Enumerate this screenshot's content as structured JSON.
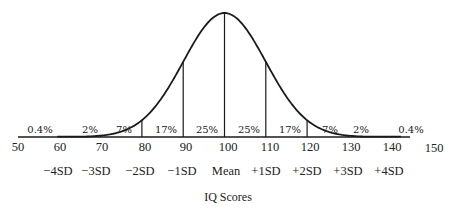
{
  "chart_data": {
    "type": "area",
    "title": "",
    "subtitle": "Normal distribution of IQ scores",
    "xlabel": "IQ Scores",
    "ylabel": "",
    "xlim": [
      50,
      150
    ],
    "grid": false,
    "legend": null,
    "mean": 100,
    "sd": 10,
    "x_ticks": [
      50,
      60,
      70,
      80,
      90,
      100,
      110,
      120,
      130,
      140,
      150
    ],
    "x_tick_labels": [
      "50",
      "60",
      "70",
      "80",
      "90",
      "100",
      "110",
      "120",
      "130",
      "140",
      "150"
    ],
    "sd_labels": [
      {
        "x": 60,
        "label": "−4SD"
      },
      {
        "x": 70,
        "label": "−3SD"
      },
      {
        "x": 80,
        "label": "−2SD"
      },
      {
        "x": 90,
        "label": "−1SD"
      },
      {
        "x": 100,
        "label": "Mean"
      },
      {
        "x": 110,
        "label": "+1SD"
      },
      {
        "x": 120,
        "label": "+2SD"
      },
      {
        "x": 130,
        "label": "+3SD"
      },
      {
        "x": 140,
        "label": "+4SD"
      }
    ],
    "dividers": [
      70,
      80,
      90,
      100,
      110,
      120,
      130
    ],
    "categories": [
      "<60",
      "60-70",
      "70-80",
      "80-90",
      "90-100",
      "100-110",
      "110-120",
      "120-130",
      "130-140",
      ">140"
    ],
    "segments": [
      {
        "from": 50,
        "to": 60,
        "label": "0.4%",
        "value": 0.4
      },
      {
        "from": 60,
        "to": 70,
        "label": "2%",
        "value": 2
      },
      {
        "from": 70,
        "to": 80,
        "label": "7%",
        "value": 7
      },
      {
        "from": 80,
        "to": 90,
        "label": "17%",
        "value": 17
      },
      {
        "from": 90,
        "to": 100,
        "label": "25%",
        "value": 25
      },
      {
        "from": 100,
        "to": 110,
        "label": "25%",
        "value": 25
      },
      {
        "from": 110,
        "to": 120,
        "label": "17%",
        "value": 17
      },
      {
        "from": 120,
        "to": 130,
        "label": "7%",
        "value": 7
      },
      {
        "from": 130,
        "to": 140,
        "label": "2%",
        "value": 2
      },
      {
        "from": 140,
        "to": 150,
        "label": "0.4%",
        "value": 0.4
      }
    ]
  },
  "labels": {
    "pct": [
      "0.4%",
      "2%",
      "7%",
      "17%",
      "25%",
      "25%",
      "17%",
      "7%",
      "2%",
      "0.4%"
    ],
    "ticks": [
      "50",
      "60",
      "70",
      "80",
      "90",
      "100",
      "110",
      "120",
      "130",
      "140",
      "150"
    ],
    "sd": [
      "−4SD",
      "−3SD",
      "−2SD",
      "−1SD",
      "Mean",
      "+1SD",
      "+2SD",
      "+3SD",
      "+4SD"
    ],
    "xlabel": "IQ Scores"
  },
  "colors": {
    "line": "#1a1a1a",
    "background": "#ffffff"
  }
}
